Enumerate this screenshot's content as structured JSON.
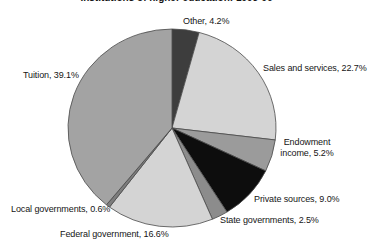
{
  "figure": {
    "background": "#ffffff"
  },
  "chart_data": {
    "type": "pie",
    "title": "Institutions of higher education: 1995-96",
    "title_note": "title is clipped at top edge of screenshot",
    "start_angle_deg": 0,
    "direction": "clockwise",
    "legend_position": "none (direct slice labels)",
    "center": {
      "x": 172,
      "y": 128
    },
    "radius": {
      "rx": 104,
      "ry": 99
    },
    "outline_color": "#4a4a4a",
    "categories": [
      "Other",
      "Sales and services",
      "Endowment income",
      "Private sources",
      "State governments",
      "Federal government",
      "Local governments",
      "Tuition"
    ],
    "values": [
      4.2,
      22.7,
      5.2,
      9.0,
      2.5,
      16.6,
      0.6,
      39.1
    ],
    "slices": [
      {
        "name": "other",
        "pct": 4.2,
        "color": "#3d3d3d",
        "label": "Other, 4.2%",
        "label_pos": {
          "x": 183,
          "y": 16
        }
      },
      {
        "name": "sales-and-services",
        "pct": 22.7,
        "color": "#d4d4d4",
        "label": "Sales and services, 22.7%",
        "label_pos": {
          "x": 263,
          "y": 63
        }
      },
      {
        "name": "endowment-income",
        "pct": 5.2,
        "color": "#9b9b9b",
        "label": "Endowment income, 5.2%",
        "label_pos": {
          "x": 274,
          "y": 137,
          "width": 66,
          "align": "center"
        }
      },
      {
        "name": "private-sources",
        "pct": 9.0,
        "color": "#0d0d0d",
        "label": "Private sources, 9.0%",
        "label_pos": {
          "x": 254,
          "y": 194
        }
      },
      {
        "name": "state-governments",
        "pct": 2.5,
        "color": "#8c8c8c",
        "label": "State governments, 2.5%",
        "label_pos": {
          "x": 220,
          "y": 215
        }
      },
      {
        "name": "federal-government",
        "pct": 16.6,
        "color": "#d4d4d4",
        "label": "Federal government, 16.6%",
        "label_pos": {
          "x": 60,
          "y": 229
        }
      },
      {
        "name": "local-governments",
        "pct": 0.6,
        "color": "#7d7d7d",
        "label": "Local governments, 0.6%",
        "label_pos": {
          "x": 11,
          "y": 204
        }
      },
      {
        "name": "tuition",
        "pct": 39.1,
        "color": "#a3a3a3",
        "label": "Tuition, 39.1%",
        "label_pos": {
          "x": 23,
          "y": 70
        }
      }
    ]
  }
}
